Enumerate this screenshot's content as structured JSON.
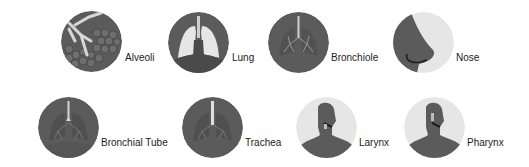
{
  "colors": {
    "dark": "#5b5b5b",
    "darker": "#4a4a4a",
    "light": "#e6e6e6",
    "text": "#222222"
  },
  "items": [
    {
      "label": "Alveoli",
      "icon": "alveoli-icon"
    },
    {
      "label": "Lung",
      "icon": "lung-icon"
    },
    {
      "label": "Bronchiole",
      "icon": "bronchiole-icon"
    },
    {
      "label": "Nose",
      "icon": "nose-icon"
    },
    {
      "label": "Bronchial Tube",
      "icon": "bronchial-tube-icon"
    },
    {
      "label": "Trachea",
      "icon": "trachea-icon"
    },
    {
      "label": "Larynx",
      "icon": "larynx-icon"
    },
    {
      "label": "Pharynx",
      "icon": "pharynx-icon"
    }
  ]
}
